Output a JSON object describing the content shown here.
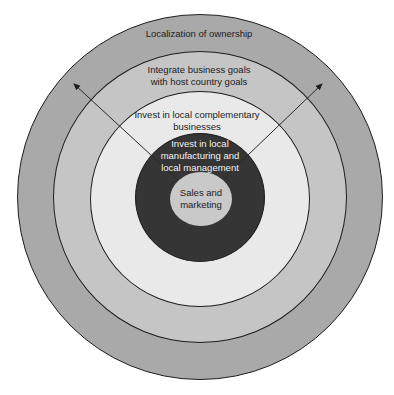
{
  "diagram": {
    "type": "concentric-circles",
    "rings": [
      {
        "id": "ring-1",
        "label": "Localization of ownership",
        "color": "#a9a9a9"
      },
      {
        "id": "ring-2",
        "label": "Integrate business goals\nwith host country goals",
        "color": "#c5c5c5"
      },
      {
        "id": "ring-3",
        "label": "Invest in local complementary\nbusinesses",
        "color": "#e9e9e9"
      },
      {
        "id": "ring-4",
        "label": "Invest in local\nmanufacturing and\nlocal management",
        "color": "#353535"
      },
      {
        "id": "ring-5",
        "label": "Sales and\nmarketing",
        "color": "#c9c9c9"
      }
    ],
    "arrows": [
      {
        "direction": "outward-left"
      },
      {
        "direction": "outward-right"
      }
    ]
  }
}
